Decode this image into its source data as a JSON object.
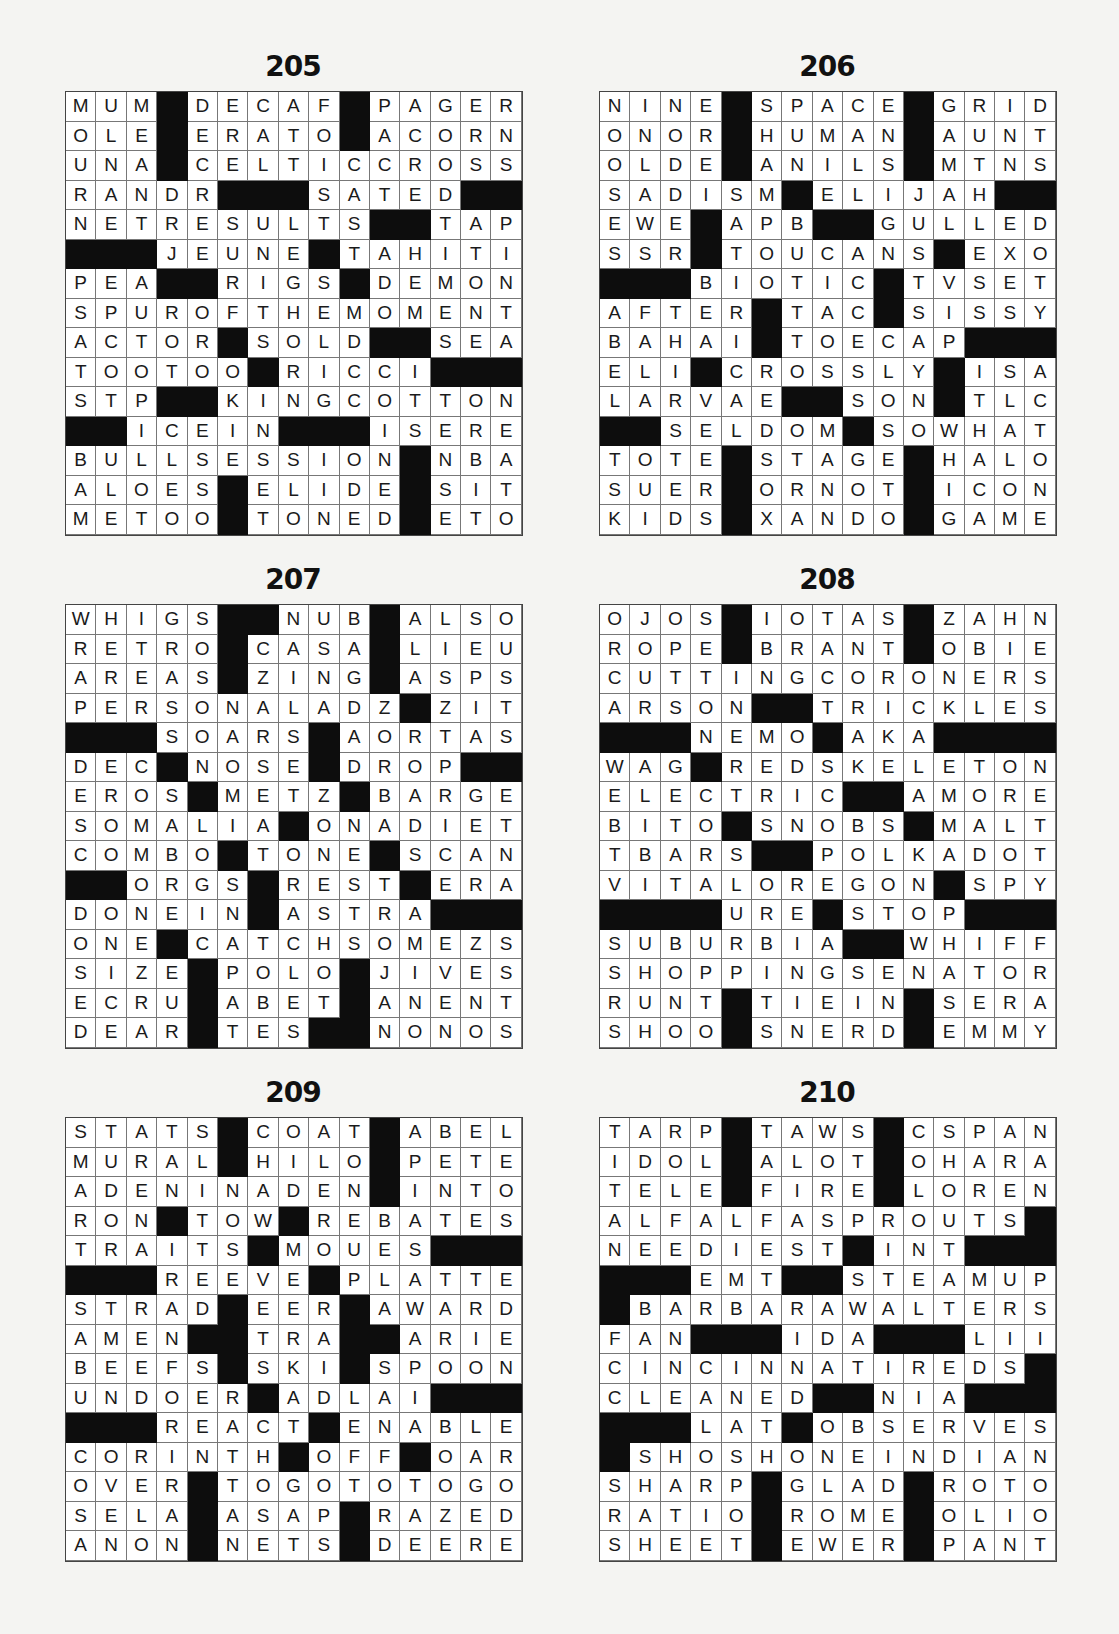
{
  "page": {
    "puzzles": [
      {
        "number": "205",
        "rows": [
          "MUM#DECAF#PAGER",
          "OLE#ERATO#ACORN",
          "UNA#CELTICCROSS",
          "RANDR###SATED##",
          "NETRESULTS##TAP",
          "###JEUNE#TAHITI",
          "PEA##RIGS#DEMON",
          "SPUROFTHEMOMENT",
          "ACTOR#SOLD##SEA",
          "TOOTOO#RICCI###",
          "STP##KINGCOTTON",
          "##ICEIN###ISERE",
          "BULLSESSION#NBA",
          "ALOES#ELIDE#SIT",
          "METOO#TONED#ETO"
        ]
      },
      {
        "number": "206",
        "rows": [
          "NINE#SPACE#GRID",
          "ONOR#HUMAN#AUNT",
          "OLDE#ANILS#MTNS",
          "SADISM#ELIJAH##",
          "EWE#APB##GULLED",
          "SSR#TOUCANS#EXO",
          "###BIOTIC#TVSET",
          "AFTER#TAC#SISSY",
          "BAHAI#TOECAP###",
          "ELI#CROSSLY#ISA",
          "LARVAE##SON#TLC",
          "##SELDOM#SOWHAT",
          "TOTE#STAGE#HALO",
          "SUER#ORNOT#ICON",
          "KIDS#XANDO#GAME"
        ]
      },
      {
        "number": "207",
        "rows": [
          "WHIGS##NUB#ALSO",
          "RETRO#CASA#LIEU",
          "AREAS#ZING#ASPS",
          "PERSONALADZ#ZIT",
          "###SOARS#AORTAS",
          "DEC#NOSE#DROP##",
          "EROS#METZ#BARGE",
          "SOMALIA#ONADIET",
          "COMBO#TONE#SCAN",
          "##ORGS#REST#ERA",
          "DONEIN#ASTRA###",
          "ONE#CATCHSOMEZS",
          "SIZE#POLO#JIVES",
          "ECRU#ABET#ANENT",
          "DEAR#TES##NONOS"
        ]
      },
      {
        "number": "208",
        "rows": [
          "OJOS#IOTAS#ZAHN",
          "ROPE#BRANT#OBIE",
          "CUTTINGCORONERS",
          "ARSON##TRICKLES",
          "###NEMO#AKA####",
          "WAG#REDSKELETON",
          "ELECTRIC##AMORE",
          "BITO#SNOBS#MALT",
          "TBARS##POLKADOT",
          "VITALOREGON#SPY",
          "####URE#STOP###",
          "SUBURBIA##WHIFF",
          "SHOPPINGSENATOR",
          "RUNT#TIEIN#SERA",
          "SHOO#SNERD#EMMY"
        ]
      },
      {
        "number": "209",
        "rows": [
          "STATS#COAT#ABEL",
          "MURAL#HILO#PETE",
          "ADENINADEN#INTO",
          "RON#TOW#REBATES",
          "TRAITS#MOUES###",
          "###REEVE#PLATTE",
          "STRAD#EER#AWARD",
          "AMEN##TRA##ARIE",
          "BEEFS#SKI#SPOON",
          "UNDOER#ADLAI###",
          "###REACT#ENABLE",
          "CORINTH#OFF#OAR",
          "OVER#TOGOTOTOGO",
          "SELA#ASAP#RAZED",
          "ANON#NETS#DEERE"
        ]
      },
      {
        "number": "210",
        "rows": [
          "TARP#TAWS#CSPAN",
          "IDOL#ALOT#OHARA",
          "TELE#FIRE#LOREN",
          "ALFALFASPROUTS#",
          "NEEDIEST#INT###",
          "###EMT##STEAMUP",
          "#BARBARAWALTERS",
          "FAN###IDA###LII",
          "CINCINNATIREDS#",
          "CLEANED##NIA###",
          "###LAT#OBSERVES",
          "#SHOSHONEINDIAN",
          "SHARP#GLAD#ROTO",
          "RATIO#ROME#OLIO",
          "SHEET#EWER#PANT"
        ]
      }
    ]
  }
}
